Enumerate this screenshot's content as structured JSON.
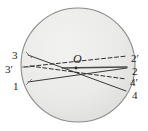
{
  "figure": {
    "type": "geometry-diagram",
    "canvas": {
      "width": 148,
      "height": 131,
      "background": "#ffffff"
    },
    "circle": {
      "name": "sphere-outline",
      "center_x": 78,
      "center_y": 65,
      "radius": 57,
      "fill": "#e9e9e7",
      "stroke": "#8a8a88",
      "stroke_width": 1.1
    },
    "center_point": {
      "label": "O",
      "x": 73,
      "y": 61,
      "marker_x": 76,
      "marker_y": 68
    },
    "labels": [
      {
        "id": "label-3",
        "text": "3",
        "x": 12,
        "y": 50,
        "side": "left",
        "ray": "ray-3-4"
      },
      {
        "id": "label-3p",
        "text": "3′",
        "x": 5,
        "y": 64,
        "side": "left",
        "ray": "ray-3p-2p"
      },
      {
        "id": "label-1",
        "text": "1",
        "x": 13,
        "y": 81,
        "side": "left",
        "ray": "ray-1-2"
      },
      {
        "id": "label-2p",
        "text": "2′",
        "x": 131,
        "y": 53,
        "side": "right",
        "ray": "ray-3p-2p"
      },
      {
        "id": "label-2",
        "text": "2",
        "x": 132,
        "y": 66,
        "side": "right",
        "ray": "ray-1-2"
      },
      {
        "id": "label-4p",
        "text": "4′",
        "x": 130,
        "y": 77,
        "side": "right",
        "ray": "ray-1p-4p"
      },
      {
        "id": "label-4",
        "text": "4",
        "x": 132,
        "y": 90,
        "side": "right",
        "ray": "ray-3-4"
      }
    ],
    "rays": [
      {
        "id": "ray-3-4",
        "style": "solid",
        "stroke": "#3a3a3a",
        "stroke_width": 1.0,
        "from_label": "3",
        "to_label": "4",
        "x1": 28,
        "y1": 55,
        "x2": 126,
        "y2": 91
      },
      {
        "id": "ray-1-2",
        "style": "solid",
        "stroke": "#3a3a3a",
        "stroke_width": 1.0,
        "from_label": "1",
        "to_label": "2",
        "x1": 28,
        "y1": 82,
        "x2": 127,
        "y2": 68
      },
      {
        "id": "ray-3p-2p",
        "style": "dashed",
        "stroke": "#2e2e2e",
        "stroke_width": 1.0,
        "dash": "4,2.5",
        "from_label": "3′",
        "to_label": "2′",
        "x1": 24,
        "y1": 67,
        "x2": 127,
        "y2": 56
      },
      {
        "id": "ray-1p-4p",
        "style": "dashed",
        "stroke": "#2e2e2e",
        "stroke_width": 1.0,
        "dash": "4,2.5",
        "from_label": "",
        "to_label": "4′",
        "x1": 30,
        "y1": 66,
        "x2": 126,
        "y2": 79
      },
      {
        "id": "ray-chord-inner",
        "style": "solid",
        "stroke": "#4a4a4a",
        "stroke_width": 1.4,
        "from_label": "",
        "to_label": "",
        "x1": 62,
        "y1": 68,
        "x2": 127,
        "y2": 67
      }
    ],
    "tick_marks": [
      {
        "id": "tick-3",
        "x1": 26,
        "y1": 52,
        "x2": 32,
        "y2": 58
      },
      {
        "id": "tick-3p",
        "x1": 22,
        "y1": 67,
        "x2": 30,
        "y2": 67
      },
      {
        "id": "tick-1",
        "x1": 26,
        "y1": 85,
        "x2": 32,
        "y2": 79
      }
    ]
  }
}
